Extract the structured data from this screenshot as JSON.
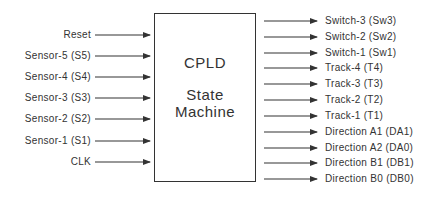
{
  "diagram": {
    "block": {
      "title_line1": "CPLD",
      "title_line2": "State",
      "title_line3": "Machine"
    },
    "inputs": [
      {
        "label": "Reset",
        "y": 35
      },
      {
        "label": "Sensor-5 (S5)",
        "y": 56
      },
      {
        "label": "Sensor-4 (S4)",
        "y": 77
      },
      {
        "label": "Sensor-3 (S3)",
        "y": 98
      },
      {
        "label": "Sensor-2 (S2)",
        "y": 119
      },
      {
        "label": "Sensor-1 (S1)",
        "y": 141
      },
      {
        "label": "CLK",
        "y": 162
      }
    ],
    "outputs": [
      {
        "label": "Switch-3 (Sw3)",
        "y": 21
      },
      {
        "label": "Switch-2 (Sw2)",
        "y": 37
      },
      {
        "label": "Switch-1 (Sw1)",
        "y": 53
      },
      {
        "label": "Track-4 (T4)",
        "y": 68
      },
      {
        "label": "Track-3 (T3)",
        "y": 84
      },
      {
        "label": "Track-2 (T2)",
        "y": 100
      },
      {
        "label": "Track-1 (T1)",
        "y": 116
      },
      {
        "label": "Direction A1 (DA1)",
        "y": 132
      },
      {
        "label": "Direction A2 (DA0)",
        "y": 148
      },
      {
        "label": "Direction B1 (DB1)",
        "y": 163
      },
      {
        "label": "Direction B0 (DB0)",
        "y": 179
      }
    ],
    "colors": {
      "line": "#333333",
      "text": "#333333",
      "background": "#ffffff"
    }
  }
}
